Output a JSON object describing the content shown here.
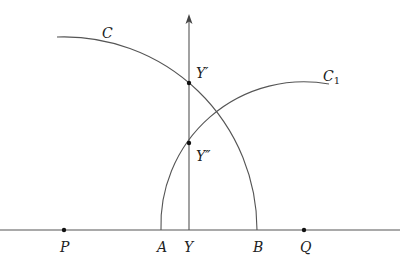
{
  "diagram": {
    "baseline": {
      "y": 230,
      "x_start": 0,
      "x_end": 400
    },
    "axis": {
      "x": 189,
      "y_bottom": 230,
      "y_top": 16,
      "arrow": "up"
    },
    "points": [
      {
        "id": "P",
        "label": "P",
        "x": 64,
        "y": 230,
        "dot": true,
        "label_x": 60,
        "label_y": 252
      },
      {
        "id": "A",
        "label": "A",
        "x": 161,
        "y": 230,
        "dot": false,
        "label_x": 157,
        "label_y": 252
      },
      {
        "id": "Y",
        "label": "Y",
        "x": 189,
        "y": 230,
        "dot": false,
        "label_x": 184,
        "label_y": 252
      },
      {
        "id": "B",
        "label": "B",
        "x": 257,
        "y": 230,
        "dot": false,
        "label_x": 253,
        "label_y": 252
      },
      {
        "id": "Q",
        "label": "Q",
        "x": 304,
        "y": 230,
        "dot": true,
        "label_x": 300,
        "label_y": 252
      },
      {
        "id": "Yp",
        "label": "Y′",
        "x": 189,
        "y": 83,
        "dot": true,
        "label_x": 196,
        "label_y": 78
      },
      {
        "id": "Ypp",
        "label": "Y″",
        "x": 189,
        "y": 143,
        "dot": true,
        "label_x": 196,
        "label_y": 161
      }
    ],
    "arcs": [
      {
        "id": "C",
        "label": "C",
        "center": "P",
        "cx": 64,
        "cy": 230,
        "r": 193,
        "start": [
          57,
          37
        ],
        "end": [
          257,
          230
        ],
        "label_x": 102,
        "label_y": 38
      },
      {
        "id": "C1",
        "label": "C",
        "subscript": "1",
        "center": "Q",
        "cx": 304,
        "cy": 230,
        "r": 143,
        "start": [
          161,
          230
        ],
        "end": [
          329,
          84
        ],
        "label_x": 323,
        "label_y": 81
      }
    ],
    "colors": {
      "line": "#555555",
      "text": "#222222",
      "dot": "#111111",
      "background": "#ffffff"
    }
  }
}
